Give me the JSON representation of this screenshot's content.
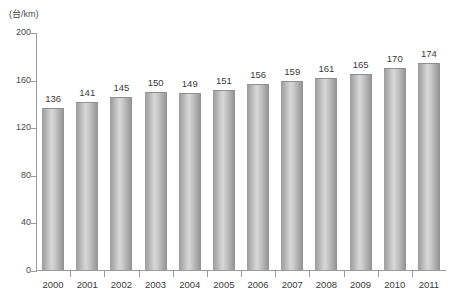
{
  "chart_data": {
    "type": "bar",
    "title": "",
    "subtitle": "",
    "xlabel": "",
    "ylabel": "(台/km)",
    "unit_label": "(台/km)",
    "categories": [
      "2000",
      "2001",
      "2002",
      "2003",
      "2004",
      "2005",
      "2006",
      "2007",
      "2008",
      "2009",
      "2010",
      "2011"
    ],
    "values": [
      136,
      141,
      145,
      150,
      149,
      151,
      156,
      159,
      161,
      165,
      170,
      174
    ],
    "value_labels": [
      "136",
      "141",
      "145",
      "150",
      "149",
      "151",
      "156",
      "159",
      "161",
      "165",
      "170",
      "174"
    ],
    "ylim": [
      0,
      200
    ],
    "yticks": [
      0,
      40,
      80,
      120,
      160,
      200
    ],
    "ytick_labels": [
      "0",
      "40",
      "80",
      "120",
      "160",
      "200"
    ],
    "grid": false,
    "legend": null,
    "legend_position": "none",
    "bar_color": "#c4c4c4",
    "axis_color": "#9a9a9a",
    "text_color": "#3a3a3a"
  }
}
